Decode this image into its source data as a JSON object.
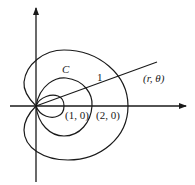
{
  "diagram": {
    "type": "polar-curves",
    "colors": {
      "stroke": "#1a1a1a",
      "background": "#ffffff"
    },
    "labels": {
      "curve_c": "C",
      "ray_length": "1",
      "point_polar": "(r, θ)",
      "point_1_0": "(1, 0)",
      "point_2_0": "(2, 0)"
    },
    "axes": {
      "x_axis": "horizontal arrow",
      "y_axis": "vertical arrow"
    }
  }
}
